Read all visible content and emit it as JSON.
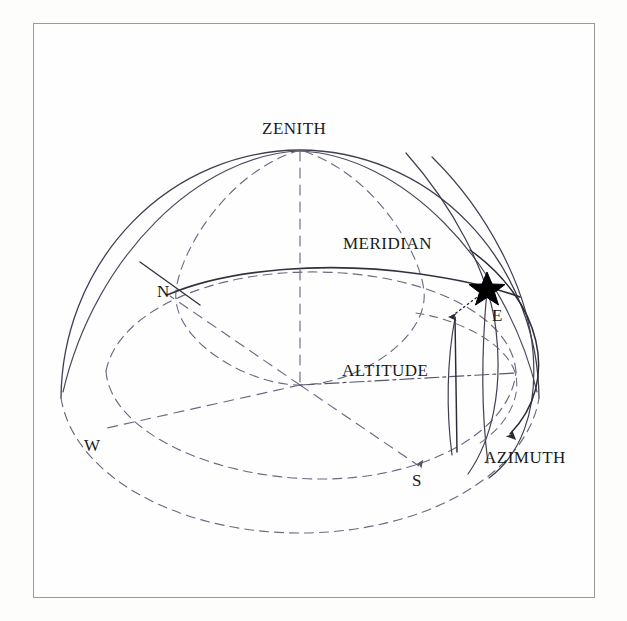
{
  "figure": {
    "type": "celestial-sphere-horizon-coordinates",
    "background_color": "#fdfdfc",
    "frame_color": "#9a9a9a",
    "line_color": "#3a3a4a",
    "star_color": "#000000"
  },
  "labels": {
    "zenith": "ZENITH",
    "meridian": "MERIDIAN",
    "altitude": "ALTITUDE",
    "azimuth": "AZIMUTH",
    "north": "N",
    "south": "S",
    "east": "E",
    "west": "W"
  },
  "geometry": {
    "center": {
      "x": 300,
      "y": 385
    },
    "sphere_radius_x": 240,
    "sphere_radius_y": 235,
    "horizon_ellipse_ry": 72,
    "star_position": {
      "x": 487,
      "y": 287
    },
    "zenith_point": {
      "x": 300,
      "y": 150
    },
    "north_point": {
      "x": 176,
      "y": 300
    },
    "south_point": {
      "x": 422,
      "y": 470
    },
    "east_point": {
      "x": 500,
      "y": 330
    },
    "west_point": {
      "x": 110,
      "y": 440
    }
  },
  "annotations": [
    {
      "name": "zenith-label",
      "text": "ZENITH",
      "x": 262,
      "y": 119
    },
    {
      "name": "meridian-label",
      "text": "MERIDIAN",
      "x": 343,
      "y": 234
    },
    {
      "name": "altitude-label",
      "text": "ALTITUDE",
      "x": 342,
      "y": 361
    },
    {
      "name": "azimuth-label",
      "text": "AZIMUTH",
      "x": 484,
      "y": 448
    },
    {
      "name": "north-label",
      "text": "N",
      "x": 157,
      "y": 282
    },
    {
      "name": "south-label",
      "text": "S",
      "x": 412,
      "y": 471
    },
    {
      "name": "east-label",
      "text": "E",
      "x": 492,
      "y": 306
    },
    {
      "name": "west-label",
      "text": "W",
      "x": 84,
      "y": 436
    }
  ]
}
